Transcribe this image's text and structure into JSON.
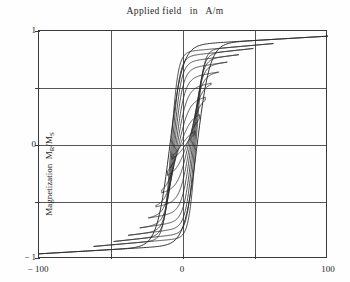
{
  "chart_data": {
    "type": "line",
    "title": "Applied field   in   A/m",
    "xlabel": "Applied field   in   A/m",
    "ylabel": "Magnetization  MR/MS",
    "ylabel_main": "Magnetization",
    "ylabel_symbol_m": "M",
    "ylabel_symbol_sub1": "R",
    "ylabel_symbol_slash": "/M",
    "ylabel_symbol_sub2": "S",
    "xlim": [
      -100,
      100
    ],
    "ylim": [
      -1,
      1
    ],
    "xticks": [
      -100,
      0,
      100
    ],
    "xtick_labels": [
      "− 100",
      "0",
      "100"
    ],
    "yticks": [
      1,
      0,
      -1
    ],
    "ytick_labels": [
      "1",
      "0",
      "− 1"
    ],
    "grid": true,
    "grid_x": [
      -50,
      0,
      50
    ],
    "grid_y": [
      0.5,
      0,
      -0.5
    ],
    "legend": null,
    "legend_position": "none",
    "line_color": "#2b2b2b",
    "series": [
      {
        "name": "major-loop",
        "saturation": 0.88,
        "coercivity": 9.5,
        "remanence": 0.42,
        "steepness": 0.115,
        "points_upper": [
          [
            -100,
            -0.88
          ],
          [
            -75,
            -0.82
          ],
          [
            -50,
            -0.74
          ],
          [
            -30,
            -0.62
          ],
          [
            -18,
            -0.42
          ],
          [
            -9.5,
            0.0
          ],
          [
            -2,
            0.33
          ],
          [
            8,
            0.52
          ],
          [
            25,
            0.68
          ],
          [
            50,
            0.78
          ],
          [
            75,
            0.84
          ],
          [
            100,
            0.88
          ]
        ],
        "points_lower": [
          [
            100,
            0.88
          ],
          [
            75,
            0.82
          ],
          [
            50,
            0.74
          ],
          [
            30,
            0.62
          ],
          [
            18,
            0.42
          ],
          [
            9.5,
            0.0
          ],
          [
            2,
            -0.33
          ],
          [
            -8,
            -0.52
          ],
          [
            -25,
            -0.68
          ],
          [
            -50,
            -0.78
          ],
          [
            -75,
            -0.84
          ],
          [
            -100,
            -0.88
          ]
        ]
      },
      {
        "name": "minor-loop-8",
        "saturation": 0.82,
        "coercivity": 8.6,
        "remanence": 0.4,
        "field_max": 62
      },
      {
        "name": "minor-loop-7",
        "saturation": 0.78,
        "coercivity": 7.8,
        "remanence": 0.37,
        "field_max": 48
      },
      {
        "name": "minor-loop-6",
        "saturation": 0.73,
        "coercivity": 7.0,
        "remanence": 0.34,
        "field_max": 38
      },
      {
        "name": "minor-loop-5",
        "saturation": 0.67,
        "coercivity": 6.2,
        "remanence": 0.3,
        "field_max": 30
      },
      {
        "name": "minor-loop-4",
        "saturation": 0.59,
        "coercivity": 5.3,
        "remanence": 0.26,
        "field_max": 24
      },
      {
        "name": "minor-loop-3",
        "saturation": 0.5,
        "coercivity": 4.4,
        "remanence": 0.21,
        "field_max": 19
      },
      {
        "name": "minor-loop-2",
        "saturation": 0.39,
        "coercivity": 3.4,
        "remanence": 0.16,
        "field_max": 15
      },
      {
        "name": "minor-loop-1",
        "saturation": 0.26,
        "coercivity": 2.4,
        "remanence": 0.1,
        "field_max": 11
      },
      {
        "name": "minor-loop-0",
        "saturation": 0.14,
        "coercivity": 1.5,
        "remanence": 0.055,
        "field_max": 8
      }
    ]
  }
}
